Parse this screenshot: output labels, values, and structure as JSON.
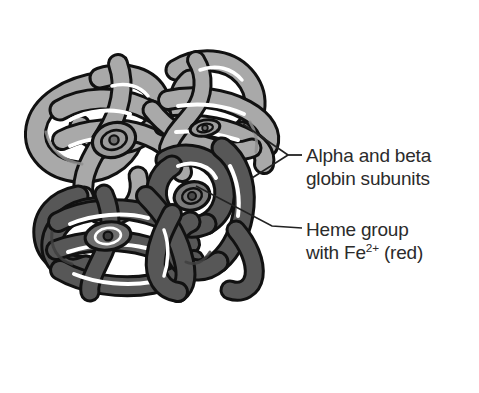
{
  "figure": {
    "background_color": "#ffffff",
    "subunit_light_color": "#a9a9a9",
    "subunit_dark_color": "#575757",
    "outline_color": "#111111",
    "highlight_color": "#ffffff",
    "text_color": "#2b2b2b",
    "leader_line_color": "#222222"
  },
  "labels": {
    "subunits": {
      "line1": "Alpha and beta",
      "line2": "globin subunits"
    },
    "heme": {
      "line1": "Heme group",
      "line2_prefix": "with Fe",
      "line2_sup": "2+",
      "line2_suffix": " (red)"
    }
  },
  "structure": {
    "subunit_count": 4,
    "light_subunits": 2,
    "dark_subunits": 2,
    "heme_group_count": 4
  }
}
